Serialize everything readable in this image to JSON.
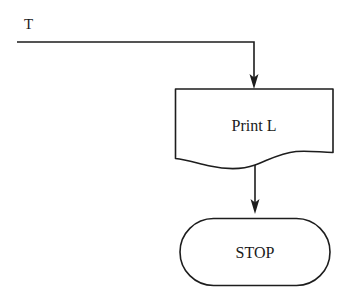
{
  "diagram": {
    "type": "flowchart",
    "title": "",
    "background_color": "#ffffff",
    "stroke_color": "#1d1d1d",
    "text_color": "#1a1a1a",
    "nodes": [
      {
        "id": "print",
        "shape": "document",
        "label": "Print L"
      },
      {
        "id": "stop",
        "shape": "terminator",
        "label": "STOP"
      }
    ],
    "edges": [
      {
        "id": "entry",
        "label": "T",
        "from": "entry-point",
        "to": "print",
        "style": "elbow-arrow"
      },
      {
        "id": "print-to-stop",
        "label": "",
        "from": "print",
        "to": "stop",
        "style": "straight-arrow"
      }
    ]
  }
}
